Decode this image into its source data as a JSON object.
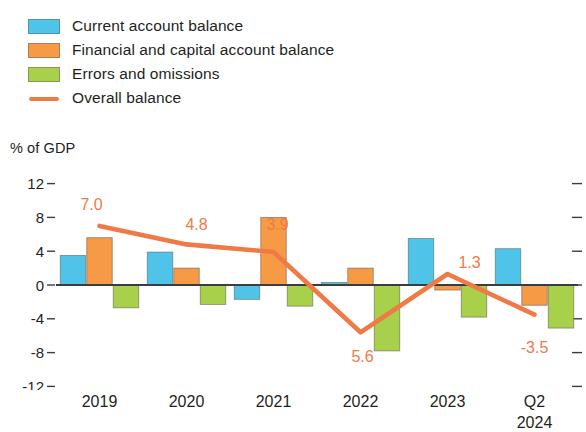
{
  "legend": {
    "items": [
      {
        "label": "Current account balance",
        "color": "#4FC3E8",
        "marker": "swatch"
      },
      {
        "label": "Financial and capital account balance",
        "color": "#F79A45",
        "marker": "swatch"
      },
      {
        "label": "Errors and omissions",
        "color": "#A8D04A",
        "marker": "swatch"
      },
      {
        "label": "Overall balance",
        "color": "#EF7A46",
        "marker": "line"
      }
    ]
  },
  "axis": {
    "y_title": "% of GDP",
    "y_ticks": [
      "12",
      "8",
      "4",
      "0",
      "-4",
      "-8",
      "-12"
    ]
  },
  "chart_data": {
    "type": "bar",
    "title": "",
    "subtitle": "",
    "xlabel": "",
    "ylabel": "% of GDP",
    "ylim": [
      -12,
      12
    ],
    "ytick_values": [
      12,
      8,
      4,
      0,
      -4,
      -8,
      -12
    ],
    "grid": false,
    "legend_position": "top-left",
    "categories": [
      "2019",
      "2020",
      "2021",
      "2022",
      "2023",
      "Q2 2024"
    ],
    "category_lines": [
      [
        "2019"
      ],
      [
        "2020"
      ],
      [
        "2021"
      ],
      [
        "2022"
      ],
      [
        "2023"
      ],
      [
        "Q2",
        "2024"
      ]
    ],
    "series": [
      {
        "name": "Current account balance",
        "type": "bar",
        "color": "#4FC3E8",
        "values": [
          3.5,
          3.9,
          -1.7,
          0.3,
          5.5,
          4.3
        ]
      },
      {
        "name": "Financial and capital account balance",
        "type": "bar",
        "color": "#F79A45",
        "values": [
          5.6,
          2.0,
          8.0,
          2.0,
          -0.6,
          -2.4
        ]
      },
      {
        "name": "Errors and omissions",
        "type": "bar",
        "color": "#A8D04A",
        "values": [
          -2.7,
          -2.3,
          -2.5,
          -7.8,
          -3.8,
          -5.1
        ]
      },
      {
        "name": "Overall balance",
        "type": "line",
        "color": "#EF7A46",
        "values": [
          7.0,
          4.8,
          3.9,
          -5.6,
          1.3,
          -3.5
        ],
        "data_labels": [
          "7.0",
          "4.8",
          "3.9",
          "5.6",
          "1.3",
          "-3.5"
        ]
      }
    ]
  }
}
